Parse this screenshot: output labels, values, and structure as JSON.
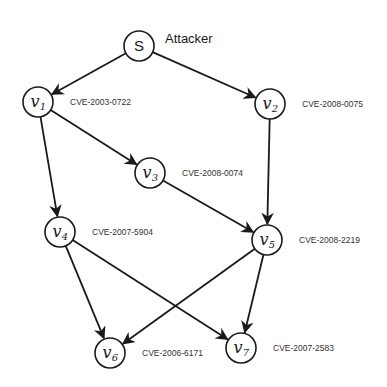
{
  "diagram": {
    "title_label": "Attacker",
    "colors": {
      "stroke": "#1a1a1a",
      "text": "#1a1a1a",
      "background": "#ffffff"
    },
    "nodes": [
      {
        "id": "S",
        "label": "S",
        "subscript": "",
        "cve": "",
        "x": 139,
        "y": 46
      },
      {
        "id": "v1",
        "label": "v",
        "subscript": "1",
        "cve": "CVE-2003-0722",
        "x": 38,
        "y": 102
      },
      {
        "id": "v2",
        "label": "v",
        "subscript": "2",
        "cve": "CVE-2008-0075",
        "x": 270,
        "y": 104
      },
      {
        "id": "v3",
        "label": "v",
        "subscript": "3",
        "cve": "CVE-2008-0074",
        "x": 150,
        "y": 173
      },
      {
        "id": "v4",
        "label": "v",
        "subscript": "4",
        "cve": "CVE-2007-5904",
        "x": 60,
        "y": 232
      },
      {
        "id": "v5",
        "label": "v",
        "subscript": "5",
        "cve": "CVE-2008-2219",
        "x": 267,
        "y": 240
      },
      {
        "id": "v6",
        "label": "v",
        "subscript": "6",
        "cve": "CVE-2006-6171",
        "x": 110,
        "y": 353
      },
      {
        "id": "v7",
        "label": "v",
        "subscript": "7",
        "cve": "CVE-2007-2583",
        "x": 241,
        "y": 348
      }
    ],
    "edges": [
      {
        "from": "S",
        "to": "v1"
      },
      {
        "from": "S",
        "to": "v2"
      },
      {
        "from": "v1",
        "to": "v3"
      },
      {
        "from": "v1",
        "to": "v4"
      },
      {
        "from": "v2",
        "to": "v5"
      },
      {
        "from": "v3",
        "to": "v5"
      },
      {
        "from": "v4",
        "to": "v6"
      },
      {
        "from": "v4",
        "to": "v7"
      },
      {
        "from": "v5",
        "to": "v6"
      },
      {
        "from": "v5",
        "to": "v7"
      }
    ]
  }
}
